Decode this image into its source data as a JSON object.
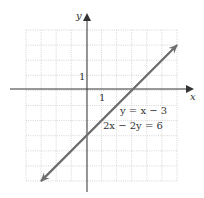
{
  "chart_data": {
    "type": "line",
    "title": "",
    "xlabel": "x",
    "ylabel": "y",
    "xlim": [
      -4,
      6
    ],
    "ylim": [
      -6,
      4
    ],
    "grid": true,
    "tick_labels": {
      "x": "1",
      "y": "1"
    },
    "series": [
      {
        "name": "y = x − 3",
        "equation_alt": "2x − 2y = 6",
        "x": [
          -3,
          6
        ],
        "y": [
          -6,
          3
        ],
        "color": "#707070"
      }
    ],
    "annotations": [
      "y = x − 3",
      "2x − 2y = 6"
    ]
  }
}
